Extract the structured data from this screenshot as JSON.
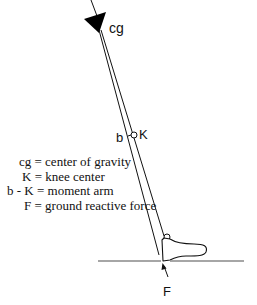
{
  "diagram": {
    "labels": {
      "cg": "cg",
      "knee": "K",
      "b": "b",
      "force": "F"
    },
    "legend": [
      {
        "key": "cg",
        "text": "cg = center of gravity"
      },
      {
        "key": "K",
        "text": "K = knee center"
      },
      {
        "key": "b - K",
        "text": "b - K = moment arm"
      },
      {
        "key": "F",
        "text": "F = ground reactive force"
      }
    ],
    "colors": {
      "stroke": "#111111",
      "ground": "#888888",
      "background": "#ffffff"
    }
  }
}
